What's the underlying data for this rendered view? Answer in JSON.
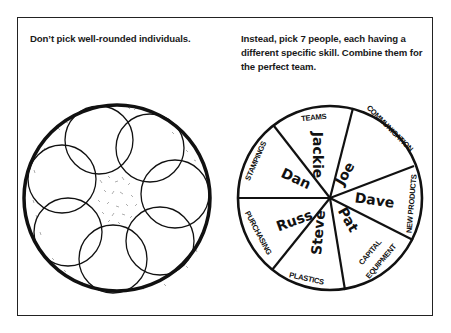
{
  "captions": {
    "left": "Don’t pick well-rounded individuals.",
    "right": "Instead, pick 7 people, each having a different specific skill. Combine them for the perfect team."
  },
  "left_figure": {
    "description": "well-rounded-individuals",
    "outer_circle": {
      "cx": 117,
      "cy": 198,
      "r": 93
    },
    "inner_circle_count": 7
  },
  "pie": {
    "center": {
      "cx": 330,
      "cy": 198
    },
    "radius": 92,
    "segments": [
      {
        "skill": "TEAMS",
        "person": "Jackie"
      },
      {
        "skill": "COMMUNICATION",
        "person": "Joe"
      },
      {
        "skill": "NEW PRODUCTS",
        "person": "Dave"
      },
      {
        "skill": "CAPITAL EQUIPMENT",
        "person": "Pat"
      },
      {
        "skill": "PLASTICS",
        "person": "Steve"
      },
      {
        "skill": "PURCHASING",
        "person": "Russ"
      },
      {
        "skill": "STAMPINGS",
        "person": "Dan"
      }
    ],
    "skill_lines": {
      "capital_1": "CAPITAL",
      "capital_2": "EQUIPMENT"
    }
  },
  "colors": {
    "ink": "#111111",
    "background": "#ffffff"
  }
}
